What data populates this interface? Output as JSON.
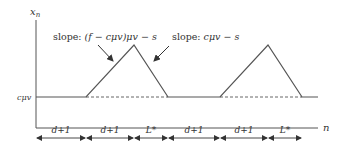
{
  "diagram": {
    "y_axis_label": "x",
    "y_axis_label_sub": "n",
    "x_axis_label": "n",
    "baseline_label": "cμv",
    "annotations": {
      "rise_slope": {
        "prefix": "slope: ",
        "expr": "(f − cμv)μv − s"
      },
      "fall_slope": {
        "prefix": "slope: ",
        "expr": "cμv − s"
      }
    },
    "intervals": [
      {
        "label": "d+1"
      },
      {
        "label": "d+1"
      },
      {
        "label": "L*"
      },
      {
        "label": "d+1"
      },
      {
        "label": "d+1"
      },
      {
        "label": "L*"
      }
    ],
    "colors": {
      "line": "#555555",
      "text": "#333333",
      "background": "#ffffff"
    }
  }
}
